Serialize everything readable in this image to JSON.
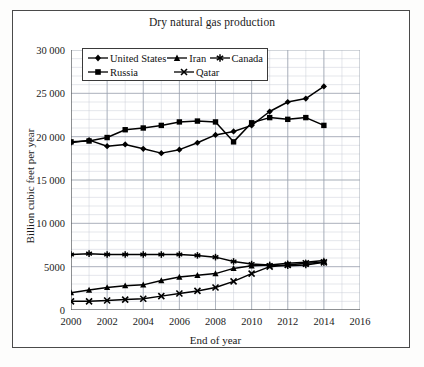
{
  "figure": {
    "title": "Dry natural gas production"
  },
  "axes": {
    "x_title": "End of year",
    "y_title": "Billion cubic feet per year",
    "x_ticks": [
      "2000",
      "2002",
      "2004",
      "2006",
      "2008",
      "2010",
      "2012",
      "2014",
      "2016"
    ],
    "y_ticks": [
      "0",
      "5000",
      "10 000",
      "15 000",
      "20 000",
      "25 000",
      "30 000"
    ]
  },
  "legend": {
    "rows": [
      [
        {
          "label": "United States",
          "marker": "diamond-marker"
        },
        {
          "label": "Iran",
          "marker": "triangle-marker"
        },
        {
          "label": "Canada",
          "marker": "asterisk-marker"
        }
      ],
      [
        {
          "label": "Russia",
          "marker": "square-marker"
        },
        {
          "label": "Qatar",
          "marker": "cross-marker"
        }
      ]
    ]
  },
  "chart_data": {
    "type": "line",
    "title": "Dry natural gas production",
    "xlabel": "End of year",
    "ylabel": "Billion cubic feet per year",
    "xlim": [
      2000,
      2016
    ],
    "ylim": [
      0,
      30000
    ],
    "x_tick_step": 2,
    "y_tick_step": 5000,
    "grid": true,
    "minor_grid": true,
    "legend_position": "top-left-inside",
    "x": [
      2000,
      2001,
      2002,
      2003,
      2004,
      2005,
      2006,
      2007,
      2008,
      2009,
      2010,
      2011,
      2012,
      2013,
      2014
    ],
    "series": [
      {
        "name": "United States",
        "marker": "diamond",
        "color": "#000000",
        "values": [
          19300,
          19600,
          18900,
          19100,
          18600,
          18100,
          18500,
          19300,
          20200,
          20600,
          21300,
          22900,
          24000,
          24400,
          25800
        ]
      },
      {
        "name": "Russia",
        "marker": "square",
        "color": "#000000",
        "values": [
          19400,
          19500,
          19900,
          20800,
          21000,
          21300,
          21700,
          21800,
          21700,
          19400,
          21600,
          22200,
          22000,
          22200,
          21300
        ]
      },
      {
        "name": "Canada",
        "marker": "asterisk",
        "color": "#000000",
        "values": [
          6400,
          6500,
          6400,
          6400,
          6400,
          6400,
          6400,
          6300,
          6100,
          5600,
          5300,
          5200,
          5100,
          5200,
          5500
        ]
      },
      {
        "name": "Iran",
        "marker": "triangle",
        "color": "#000000",
        "values": [
          2000,
          2300,
          2600,
          2800,
          2900,
          3400,
          3800,
          4000,
          4200,
          4800,
          5100,
          5200,
          5400,
          5500,
          5700
        ]
      },
      {
        "name": "Qatar",
        "marker": "cross",
        "color": "#000000",
        "values": [
          1000,
          1000,
          1100,
          1200,
          1300,
          1600,
          1900,
          2200,
          2600,
          3300,
          4200,
          5000,
          5200,
          5400,
          5500
        ]
      }
    ]
  }
}
